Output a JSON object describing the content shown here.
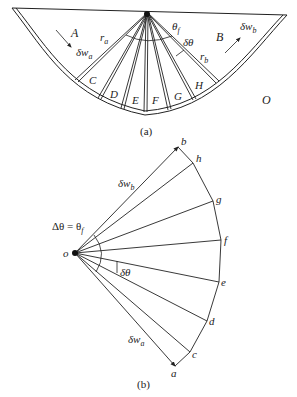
{
  "figure_a": {
    "caption": "(a)",
    "regions": {
      "A": "A",
      "B": "B",
      "C": "C",
      "D": "D",
      "E": "E",
      "F": "F",
      "G": "G",
      "H": "H",
      "O": "O"
    },
    "labels": {
      "delta_w_a": "δw",
      "delta_w_a_sub": "a",
      "delta_w_b": "δw",
      "delta_w_b_sub": "b",
      "r_a": "r",
      "r_a_sub": "a",
      "r_b": "r",
      "r_b_sub": "b",
      "theta_f": "θ",
      "theta_f_sub": "f",
      "delta_theta": "δθ"
    }
  },
  "figure_b": {
    "caption": "(b)",
    "points": {
      "o": "o",
      "a": "a",
      "b": "b",
      "c": "c",
      "d": "d",
      "e": "e",
      "f": "f",
      "g": "g",
      "h": "h"
    },
    "labels": {
      "delta_theta_eq": "Δθ = θ",
      "delta_theta_eq_sub": "f",
      "delta_theta": "δθ",
      "delta_w_a": "δw",
      "delta_w_a_sub": "a",
      "delta_w_b": "δw",
      "delta_w_b_sub": "b"
    }
  }
}
